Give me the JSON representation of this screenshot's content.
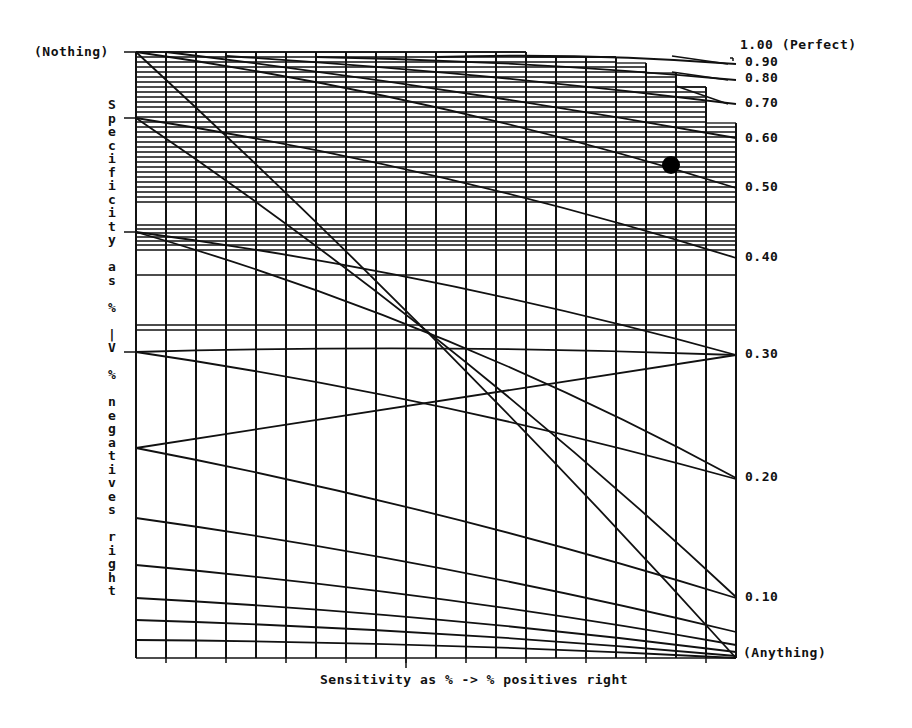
{
  "chart_data": {
    "type": "line",
    "title": "",
    "xlabel": "Sensitivity as % -> % positives right",
    "ylabel": "Specificity as % -> % negatives right",
    "left_top_label": "(Nothing)",
    "right_top_label": "1.00 (Perfect)",
    "right_bottom_label": "(Anything)",
    "right_tick_labels": [
      "0.90",
      "0.80",
      "0.70",
      "0.60",
      "0.50",
      "0.40",
      "0.30",
      "0.20",
      "0.10"
    ],
    "series": [
      {
        "name": "1.00",
        "end_y_px": 52
      },
      {
        "name": "0.90",
        "end_y_px": 64
      },
      {
        "name": "0.80",
        "end_y_px": 80
      },
      {
        "name": "0.70",
        "end_y_px": 104
      },
      {
        "name": "0.60",
        "end_y_px": 140
      },
      {
        "name": "0.50",
        "end_y_px": 188
      },
      {
        "name": "0.40",
        "end_y_px": 258
      },
      {
        "name": "0.30",
        "end_y_px": 355
      },
      {
        "name": "0.20",
        "end_y_px": 479
      },
      {
        "name": "0.10",
        "end_y_px": 598
      }
    ],
    "grid": {
      "vertical_columns": 20,
      "horizontal": "dense near top, sparse below"
    },
    "marker": {
      "label": "point",
      "x_px": 671,
      "y_px": 165
    }
  },
  "labels": {
    "nothing": "(Nothing)",
    "perfect": "1.00 (Perfect)",
    "anything": "(Anything)",
    "xaxis": "Sensitivity as % -> % positives right",
    "yaxis_chars": [
      "S",
      "p",
      "e",
      "c",
      "i",
      "f",
      "i",
      "c",
      "i",
      "t",
      "y",
      "",
      "a",
      "s",
      "",
      "%",
      "",
      "|",
      "V",
      "",
      "%",
      "",
      "n",
      "e",
      "g",
      "a",
      "t",
      "i",
      "v",
      "e",
      "s",
      "",
      "r",
      "i",
      "g",
      "h",
      "t"
    ],
    "ticks": [
      {
        "text": "0.90",
        "y": 62
      },
      {
        "text": "0.80",
        "y": 78
      },
      {
        "text": "0.70",
        "y": 103
      },
      {
        "text": "0.60",
        "y": 138
      },
      {
        "text": "0.50",
        "y": 187
      },
      {
        "text": "0.40",
        "y": 257
      },
      {
        "text": "0.30",
        "y": 354
      },
      {
        "text": "0.20",
        "y": 477
      },
      {
        "text": "0.10",
        "y": 597
      }
    ]
  }
}
